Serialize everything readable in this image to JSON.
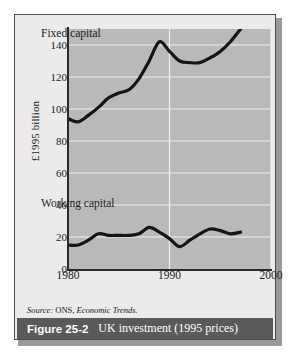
{
  "figure": {
    "number_label": "Figure 25-2",
    "title": "UK investment (1995 prices)",
    "source": "Source:",
    "source_org": " ONS, ",
    "source_pub": "Economic Trends."
  },
  "chart_data": {
    "type": "line",
    "title": "UK investment (1995 prices)",
    "xlabel": "",
    "ylabel": "£1995 billion",
    "xlim": [
      1980,
      2000
    ],
    "ylim": [
      0,
      150
    ],
    "yticks": [
      0,
      20,
      40,
      60,
      80,
      100,
      120,
      140
    ],
    "xticks": [
      1980,
      1990,
      2000
    ],
    "grid": true,
    "legend": "inline-annotations",
    "series": [
      {
        "name": "Fixed capital",
        "x": [
          1980,
          1981,
          1982,
          1983,
          1984,
          1985,
          1986,
          1987,
          1988,
          1989,
          1990,
          1991,
          1992,
          1993,
          1994,
          1995,
          1996,
          1997
        ],
        "values": [
          94,
          92,
          96,
          101,
          107,
          110,
          112,
          119,
          130,
          142,
          136,
          130,
          129,
          129,
          132,
          136,
          142,
          150
        ]
      },
      {
        "name": "Working capital",
        "x": [
          1980,
          1981,
          1982,
          1983,
          1984,
          1985,
          1986,
          1987,
          1988,
          1989,
          1990,
          1991,
          1992,
          1993,
          1994,
          1995,
          1996,
          1997
        ],
        "values": [
          15,
          15,
          18,
          22,
          21,
          21,
          21,
          22,
          26,
          23,
          19,
          14,
          18,
          22,
          25,
          24,
          22,
          23
        ]
      }
    ]
  },
  "colors": {
    "line": "#141414",
    "plot_background": "#b9b9b9",
    "gridline": "#f0f0f0",
    "panel_background": "#eceaea",
    "caption_bar": "#5a5a5a"
  }
}
